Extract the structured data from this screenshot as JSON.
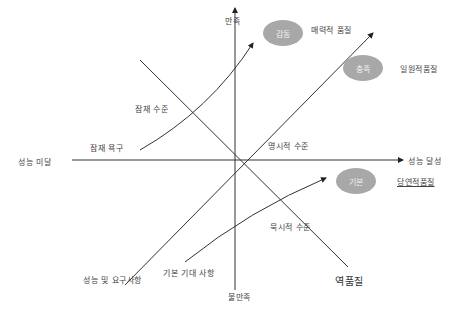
{
  "axes": {
    "y_top": "만족",
    "y_bottom": "불만족",
    "x_left": "성능  미달",
    "x_right": "성능  달성"
  },
  "ellipses": [
    {
      "label": "감동",
      "caption": "매력적 품질"
    },
    {
      "label": "충족",
      "caption": "일원적품질"
    },
    {
      "label": "기본",
      "caption": "당연적품질"
    }
  ],
  "labels": {
    "latent_level": "잠재 수준",
    "latent_needs": "잠재 욕구",
    "explicit_level": "명시적 수준",
    "implicit_level": "묵시적 수준",
    "performance_requirements": "성능 및 요구사항",
    "basic_expectations": "기본 기대 사항",
    "reverse_quality": "역품질"
  },
  "colors": {
    "ellipse": "#a8a8a8",
    "line": "#333333"
  }
}
